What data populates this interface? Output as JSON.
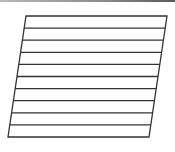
{
  "diagram": {
    "shape": "parallelogram",
    "corners": {
      "top_left": [
        26,
        16
      ],
      "top_right": [
        167,
        16
      ],
      "bottom_right": [
        149,
        137
      ],
      "bottom_left": [
        8,
        137
      ]
    },
    "band_count": 10,
    "line_color": "#333333",
    "line_width": 1.3,
    "fill": "#ffffff"
  },
  "frame": {
    "top_bar_color": "#7a7a7a"
  }
}
